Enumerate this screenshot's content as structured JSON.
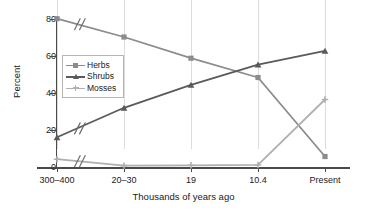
{
  "chart_data": {
    "type": "line",
    "title": "",
    "xlabel": "Thousands of years ago",
    "ylabel": "Percent",
    "categories": [
      "300–400",
      "20–30",
      "19",
      "10.4",
      "Present"
    ],
    "ylim": [
      0,
      80
    ],
    "yticks": [
      0,
      20,
      40,
      60,
      80
    ],
    "grid": "vertical",
    "legend_position": "inside-upper-left",
    "axis_break": "slash marks between first and second category on each series",
    "series": [
      {
        "name": "Herbs",
        "marker": "square",
        "color": "#8c8c8c",
        "values": [
          81,
          71,
          59.5,
          49,
          6
        ]
      },
      {
        "name": "Shrubs",
        "marker": "triangle",
        "color": "#5a5a5a",
        "values": [
          16.5,
          32.5,
          45,
          56,
          63.5
        ]
      },
      {
        "name": "Mosses",
        "marker": "plus",
        "color": "#b0b0b0",
        "values": [
          4.5,
          1,
          1.2,
          1.4,
          37
        ]
      }
    ]
  },
  "legend": {
    "items": [
      {
        "label": "Herbs"
      },
      {
        "label": "Shrubs"
      },
      {
        "label": "Mosses"
      }
    ]
  },
  "axes": {
    "y_title": "Percent",
    "x_title": "Thousands of years ago",
    "y_tick_labels": [
      "80",
      "60",
      "40",
      "20",
      "0"
    ],
    "x_tick_labels": [
      "300–400",
      "20–30",
      "19",
      "10.4",
      "Present"
    ]
  },
  "colors": {
    "herbs": "#8c8c8c",
    "shrubs": "#5a5a5a",
    "mosses": "#b0b0b0",
    "axis": "#4a4a4a",
    "grid": "#dcdcdc",
    "background": "#ffffff"
  }
}
